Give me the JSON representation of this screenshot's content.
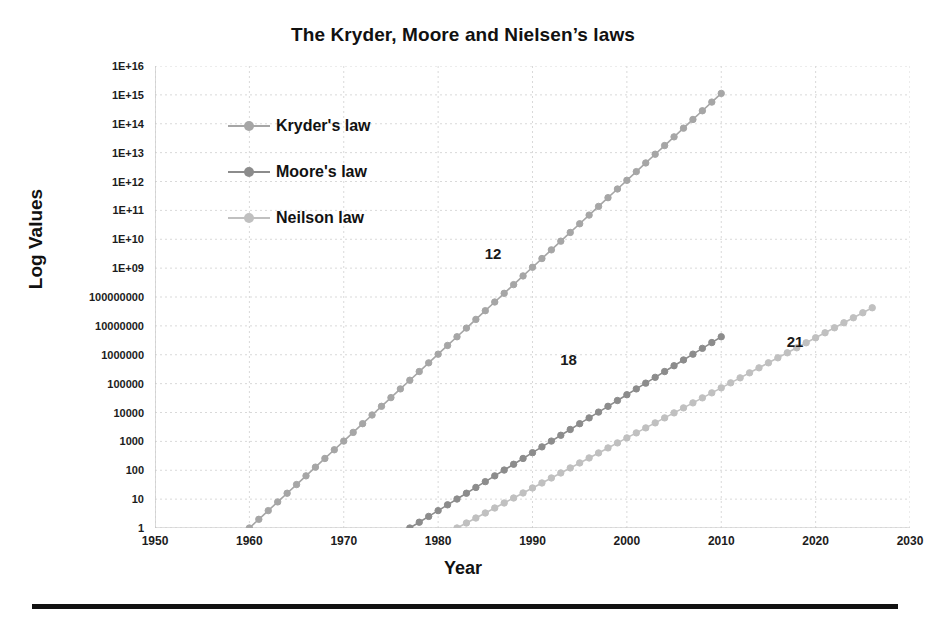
{
  "chart_data": {
    "type": "line",
    "title": "The Kryder, Moore and Nielsen’s laws",
    "xlabel": "Year",
    "ylabel": "Log Values",
    "xlim": [
      1950,
      2030
    ],
    "ylim": [
      1,
      1e+16
    ],
    "yscale": "log",
    "grid": true,
    "legend_position": "upper-left-inside",
    "xticks": [
      "1950",
      "1960",
      "1970",
      "1980",
      "1990",
      "2000",
      "2010",
      "2020",
      "2030"
    ],
    "xtick_values": [
      1950,
      1960,
      1970,
      1980,
      1990,
      2000,
      2010,
      2020,
      2030
    ],
    "yticks": [
      "1",
      "10",
      "100",
      "1000",
      "10000",
      "100000",
      "1000000",
      "10000000",
      "100000000",
      "1E+09",
      "1E+10",
      "1E+11",
      "1E+12",
      "1E+13",
      "1E+14",
      "1E+15",
      "1E+16"
    ],
    "ytick_values": [
      1,
      10,
      100,
      1000,
      10000,
      100000,
      1000000,
      10000000,
      100000000,
      1000000000.0,
      10000000000.0,
      100000000000.0,
      1000000000000.0,
      10000000000000.0,
      100000000000000.0,
      1000000000000000.0,
      1e+16
    ],
    "annotations": [
      {
        "text": "12",
        "x": 1986,
        "y": 2800000000.0,
        "note": "doubling months label on Kryder's law"
      },
      {
        "text": "18",
        "x": 1994,
        "y": 600000.0,
        "note": "doubling months label on Moore's law"
      },
      {
        "text": "21",
        "x": 2018,
        "y": 2500000.0,
        "note": "doubling months label on Neilson law"
      }
    ],
    "series": [
      {
        "name": "Kryder's law",
        "color": "#a6a6a6",
        "marker": "circle",
        "doubling_months": 12,
        "x_start": 1960,
        "x_end": 2010,
        "y_start": 1,
        "y_end": 1000000000000000.0,
        "x": [
          1960,
          1961,
          1962,
          1963,
          1964,
          1965,
          1966,
          1967,
          1968,
          1969,
          1970,
          1971,
          1972,
          1973,
          1974,
          1975,
          1976,
          1977,
          1978,
          1979,
          1980,
          1981,
          1982,
          1983,
          1984,
          1985,
          1986,
          1987,
          1988,
          1989,
          1990,
          1991,
          1992,
          1993,
          1994,
          1995,
          1996,
          1997,
          1998,
          1999,
          2000,
          2001,
          2002,
          2003,
          2004,
          2005,
          2006,
          2007,
          2008,
          2009,
          2010
        ],
        "y": [
          1,
          2,
          4,
          8,
          16,
          32,
          64,
          128,
          256,
          512,
          1024,
          2048,
          4096,
          8192,
          16384,
          32768,
          65536,
          131072,
          262144,
          524288,
          1048576,
          2097152,
          4194304,
          8388608,
          16777216,
          33554432,
          67108864,
          134217728,
          268435456,
          536870912,
          1073741824,
          2147483648,
          4294967296,
          8589934592,
          17179869184,
          34359738368,
          68719476736,
          137438953472,
          274877906944,
          549755813888,
          1099511627776,
          2199023255552,
          4398046511104,
          8796093022208,
          17592186044416,
          35184372088832,
          70368744177664,
          140737488355328,
          281474976710656,
          562949953421312,
          1125899906842624
        ]
      },
      {
        "name": "Moore's law",
        "color": "#8c8c8c",
        "marker": "circle",
        "doubling_months": 18,
        "x_start": 1977,
        "x_end": 2010,
        "y_start": 1,
        "y_end": 5592405,
        "x": [
          1977,
          1978,
          1979,
          1980,
          1981,
          1982,
          1983,
          1984,
          1985,
          1986,
          1987,
          1988,
          1989,
          1990,
          1991,
          1992,
          1993,
          1994,
          1995,
          1996,
          1997,
          1998,
          1999,
          2000,
          2001,
          2002,
          2003,
          2004,
          2005,
          2006,
          2007,
          2008,
          2009,
          2010
        ],
        "y": [
          1,
          1.587,
          2.52,
          4,
          6.35,
          10.08,
          16,
          25.4,
          40.32,
          64,
          101.6,
          161.3,
          256,
          406.4,
          645.1,
          1024,
          1625.5,
          2580.3,
          4096,
          6502,
          10321,
          16384,
          26008,
          41285,
          65536,
          104032,
          165140,
          262144,
          416128,
          660561,
          1048576,
          1664511,
          2642245,
          4194304
        ]
      },
      {
        "name": "Neilson law",
        "color": "#c0c0c0",
        "marker": "circle",
        "doubling_months": 21,
        "x_start": 1982,
        "x_end": 2026,
        "y_start": 1,
        "y_end": 5000000,
        "x": [
          1982,
          1983,
          1984,
          1985,
          1986,
          1987,
          1988,
          1989,
          1990,
          1991,
          1992,
          1993,
          1994,
          1995,
          1996,
          1997,
          1998,
          1999,
          2000,
          2001,
          2002,
          2003,
          2004,
          2005,
          2006,
          2007,
          2008,
          2009,
          2010,
          2011,
          2012,
          2013,
          2014,
          2015,
          2016,
          2017,
          2018,
          2019,
          2020,
          2021,
          2022,
          2023,
          2024,
          2025,
          2026
        ],
        "y": [
          1,
          1.49,
          2.22,
          3.31,
          4.93,
          7.35,
          10.96,
          16.33,
          24.35,
          36.3,
          54.1,
          80.6,
          120.2,
          179.2,
          267.1,
          398.1,
          593.4,
          884.7,
          1318.7,
          1965.7,
          2930.1,
          4367.6,
          6510.7,
          9704.3,
          14465,
          21561,
          32138,
          47904,
          71406,
          106440,
          158650,
          236490,
          352510,
          525440,
          783210,
          1167400,
          1740100,
          2593700,
          3866200,
          5763100,
          8590400,
          12805000,
          19086000,
          28450000,
          42410000
        ]
      }
    ]
  },
  "axes": {
    "y_title": "Log Values",
    "x_title": "Year"
  },
  "legend": {
    "items": [
      {
        "label": "Kryder's law",
        "color": "#a6a6a6"
      },
      {
        "label": "Moore's law",
        "color": "#8c8c8c"
      },
      {
        "label": "Neilson law",
        "color": "#c0c0c0"
      }
    ]
  },
  "style": {
    "background": "#ffffff",
    "grid_color": "#d9d9d9",
    "axis_color": "#bfbfbf",
    "text_color": "#1a1a1a",
    "rule_color": "#111111"
  }
}
